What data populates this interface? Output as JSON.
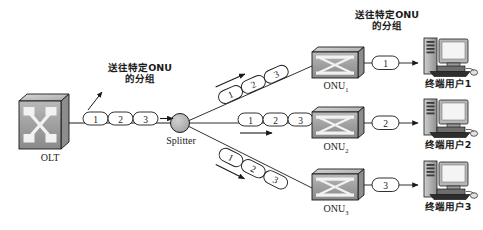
{
  "diagram": {
    "annotations": {
      "left_note_line1": "送往特定ONU",
      "left_note_line2": "的分组",
      "right_note_line1": "送往特定ONU",
      "right_note_line2": "的分组"
    },
    "nodes": {
      "olt": {
        "label": "OLT",
        "icon": "switch-cube-icon"
      },
      "splitter": {
        "label": "Splitter",
        "icon": "splitter-circle-icon"
      },
      "onu1": {
        "label": "ONU",
        "subscript": "1",
        "icon": "switch-box-icon"
      },
      "onu2": {
        "label": "ONU",
        "subscript": "2",
        "icon": "switch-box-icon"
      },
      "onu3": {
        "label": "ONU",
        "subscript": "3",
        "icon": "switch-box-icon"
      },
      "user1": {
        "label": "终端用户1",
        "icon": "desktop-computer-icon"
      },
      "user2": {
        "label": "终端用户2",
        "icon": "desktop-computer-icon"
      },
      "user3": {
        "label": "终端用户3",
        "icon": "desktop-computer-icon"
      }
    },
    "packets": {
      "feeder": [
        "1",
        "2",
        "3"
      ],
      "branch_up": [
        "1",
        "2",
        "3"
      ],
      "branch_mid": [
        "1",
        "2",
        "3"
      ],
      "branch_down": [
        "1",
        "2",
        "3"
      ],
      "drop1": [
        "1"
      ],
      "drop2": [
        "2"
      ],
      "drop3": [
        "3"
      ]
    },
    "colors": {
      "stroke": "#1a1a1a",
      "device_fill": "#9a9a9a",
      "device_light": "#e8e8e8",
      "splitter_fill": "#b5b5b5",
      "background": "#ffffff"
    }
  }
}
